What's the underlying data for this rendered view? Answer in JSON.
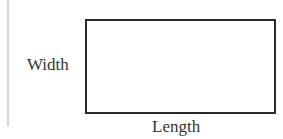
{
  "diagram": {
    "shape": "rectangle",
    "labels": {
      "width": "Width",
      "length": "Length"
    },
    "colors": {
      "stroke": "#2a2a2a",
      "text": "#333333",
      "margin_line": "#d4d4d4"
    }
  }
}
